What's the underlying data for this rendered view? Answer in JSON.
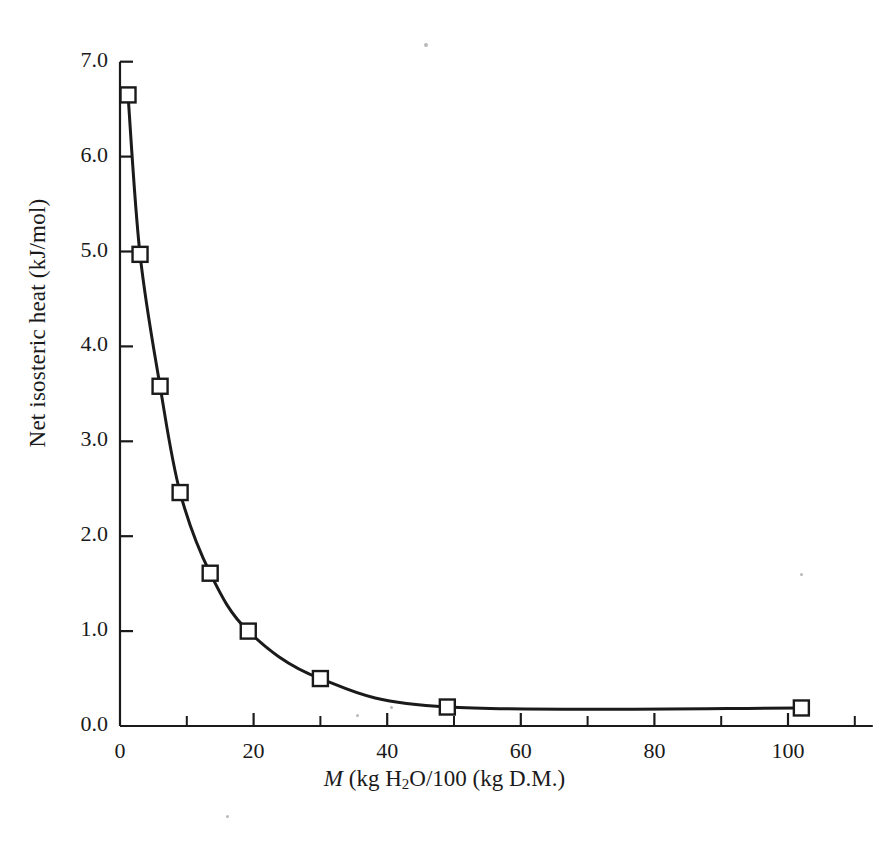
{
  "chart_data": {
    "type": "line",
    "title": "",
    "xlabel": "M (kg H2O/100 (kg D.M.)",
    "xlabel_parts": {
      "italic": "M",
      "rest_before_sub": " (kg H",
      "subscript": "2",
      "rest_after_sub": "O/100 (kg D.M.)"
    },
    "ylabel": "Net isosteric heat (kJ/mol)",
    "xlim": [
      0,
      110
    ],
    "ylim": [
      0.0,
      7.0
    ],
    "xticks": [
      0,
      20,
      40,
      60,
      80,
      100
    ],
    "xtick_labels": [
      "0",
      "20",
      "40",
      "60",
      "80",
      "100"
    ],
    "xminor_ticks": [
      10,
      30,
      50,
      70,
      90,
      110
    ],
    "yticks": [
      0.0,
      1.0,
      2.0,
      3.0,
      4.0,
      5.0,
      6.0,
      7.0
    ],
    "ytick_labels": [
      "0.0",
      "1.0",
      "2.0",
      "3.0",
      "4.0",
      "5.0",
      "6.0",
      "7.0"
    ],
    "grid": false,
    "legend": null,
    "series": [
      {
        "name": "Net isosteric heat",
        "marker": "open-square",
        "marker_color": "#ffffff",
        "line_color": "#1a1a1a",
        "x": [
          1.2,
          3.0,
          6.0,
          9.0,
          13.5,
          19.2,
          30.0,
          49.0,
          102.0
        ],
        "y": [
          6.65,
          4.97,
          3.58,
          2.46,
          1.61,
          1.0,
          0.5,
          0.2,
          0.19
        ]
      }
    ]
  },
  "figure": {
    "axis_color": "#1a1a1a",
    "background": "#ffffff"
  }
}
